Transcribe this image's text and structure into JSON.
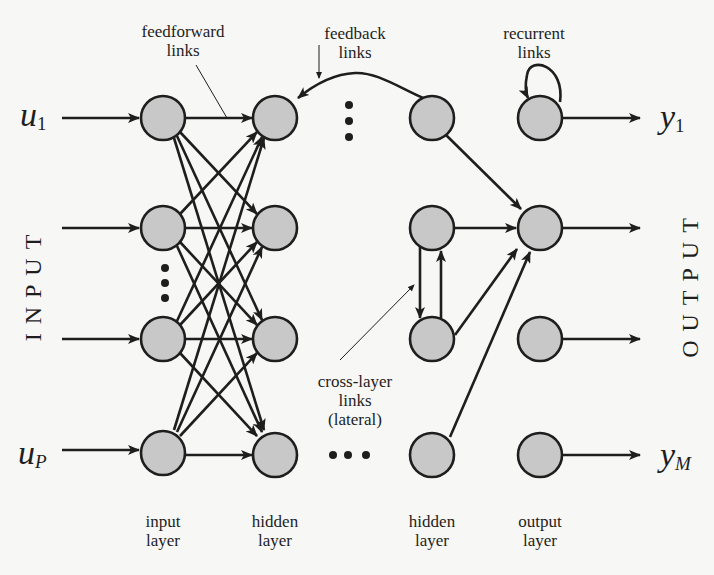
{
  "diagram": {
    "side_labels": {
      "input": "INPUT",
      "output": "OUTPUT"
    },
    "inputs": {
      "first": {
        "base": "u",
        "sub": "1"
      },
      "last": {
        "base": "u",
        "sub": "P"
      }
    },
    "outputs": {
      "first": {
        "base": "y",
        "sub": "1"
      },
      "last": {
        "base": "y",
        "sub": "M"
      }
    },
    "annotations": {
      "feedforward": "feedforward\nlinks",
      "feedback": "feedback\nlinks",
      "recurrent": "recurrent\nlinks",
      "cross_layer": "cross-layer\nlinks\n(lateral)"
    },
    "layers": [
      {
        "id": "input",
        "label": "input\nlayer",
        "x": 163
      },
      {
        "id": "hidden1",
        "label": "hidden\nlayer",
        "x": 275
      },
      {
        "id": "hidden2",
        "label": "hidden\nlayer",
        "x": 432
      },
      {
        "id": "output",
        "label": "output\nlayer",
        "x": 540
      }
    ],
    "node_rows_y": [
      118,
      228,
      339,
      450
    ],
    "node_radius": 22,
    "colors": {
      "node_fill": "#c8c8c8",
      "stroke": "#1e1e1e",
      "background": "#f7f7f5"
    }
  }
}
